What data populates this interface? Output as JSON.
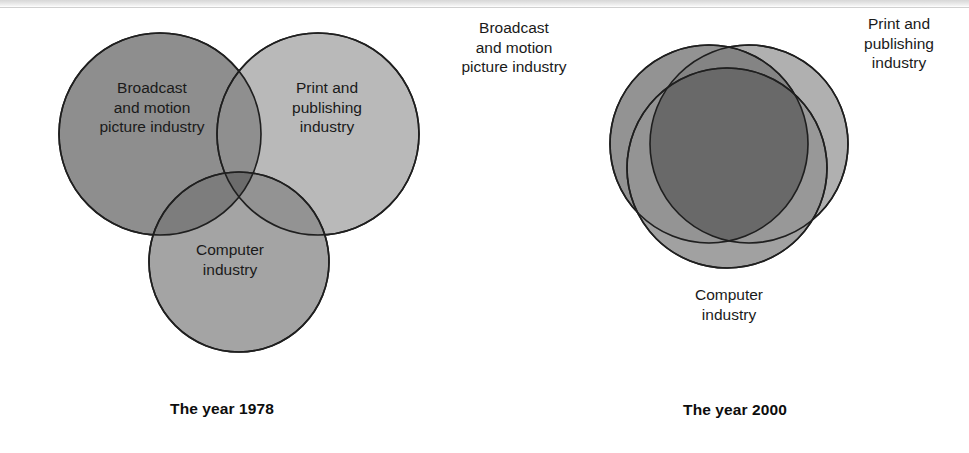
{
  "figure": {
    "type": "venn-diagram-pair"
  },
  "colors": {
    "background": "#ffffff",
    "broadcast_fill": "#8e8e8e",
    "print_fill": "#b3b3b3",
    "computer_fill": "#9c9c9c",
    "outline": "#1f1f1f",
    "text": "#1a1a1a",
    "caption_text": "#0d0d0d"
  },
  "panels": [
    {
      "id": "year-1978",
      "caption": "The year 1978",
      "description": "Three industry circles that only touch at a single shared point, with almost no overlap.",
      "labels_inside_circles": true,
      "circles": [
        {
          "key": "broadcast",
          "label": "Broadcast\nand motion\npicture industry",
          "fill": "#8e8e8e",
          "cx": 160,
          "cy": 134,
          "r": 101
        },
        {
          "key": "print",
          "label": "Print and\npublishing\nindustry",
          "fill": "#b3b3b3",
          "cx": 318,
          "cy": 134,
          "r": 101
        },
        {
          "key": "computer",
          "label": "Computer\nindustry",
          "fill": "#9c9c9c",
          "cx": 239,
          "cy": 262,
          "r": 90
        }
      ]
    },
    {
      "id": "year-2000",
      "caption": "The year 2000",
      "description": "Three industry circles overlapping almost completely, producing a large dark shared core.",
      "labels_inside_circles": false,
      "circles": [
        {
          "key": "broadcast",
          "label": "Broadcast\nand motion\npicture industry",
          "fill": "#8e8e8e",
          "cx": 225,
          "cy": 144,
          "r": 99
        },
        {
          "key": "print",
          "label": "Print and\npublishing\nindustry",
          "fill": "#b3b3b3",
          "cx": 265,
          "cy": 144,
          "r": 99
        },
        {
          "key": "computer",
          "label": "Computer\nindustry",
          "fill": "#9c9c9c",
          "cx": 243,
          "cy": 168,
          "r": 100
        }
      ]
    }
  ],
  "chart_data": {
    "type": "venn",
    "sets": [
      "Broadcast and motion picture industry",
      "Print and publishing industry",
      "Computer industry"
    ],
    "panels": [
      {
        "label": "The year 1978",
        "overlap": "minimal",
        "note": "circles meet at a single point; industries are largely separate"
      },
      {
        "label": "The year 2000",
        "overlap": "near-total",
        "note": "circles almost coincide; industries have converged"
      }
    ],
    "legend": "none",
    "grid": false
  }
}
